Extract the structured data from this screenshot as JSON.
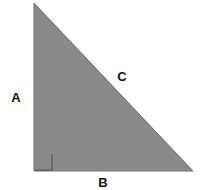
{
  "figure": {
    "kind": "right-triangle-diagram",
    "background_color": "#ffffff",
    "canvas": {
      "width": 205,
      "height": 190
    },
    "triangle": {
      "fill_color": "#8a8a8a",
      "stroke_color": "#6e6e6e",
      "stroke_width": 1,
      "vertices": [
        {
          "name": "apex",
          "x": 34,
          "y": 3
        },
        {
          "name": "right-angle-vertex",
          "x": 34,
          "y": 171
        },
        {
          "name": "base-right-vertex",
          "x": 193,
          "y": 171
        }
      ],
      "points_attr": "34,3 34,171 193,171"
    },
    "right_angle_marker": {
      "stroke_color": "#4d4d4d",
      "stroke_width": 1,
      "size": 17,
      "x": 35,
      "y": 154,
      "path_attr": "M 52,154 L 52,170 L 35,170"
    },
    "labels": {
      "leg_vertical": "A",
      "leg_horizontal": "B",
      "hypotenuse": "C"
    }
  }
}
